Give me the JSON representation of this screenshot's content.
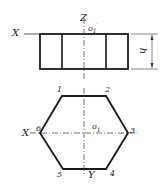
{
  "diagram": {
    "front_view": {
      "axis_x_label": "X",
      "axis_z_label": "Z",
      "origin_label": "o",
      "origin_subscript": "1",
      "origin_prime": "′",
      "height_label": "h"
    },
    "top_view": {
      "axis_x_label": "X",
      "axis_y_label": "Y",
      "origin_label": "o",
      "origin_subscript": "1",
      "vertices": [
        "1",
        "2",
        "3",
        "4",
        "5",
        "6"
      ]
    },
    "colors": {
      "line": "#1a1a1a",
      "background": "#ffffff"
    }
  }
}
